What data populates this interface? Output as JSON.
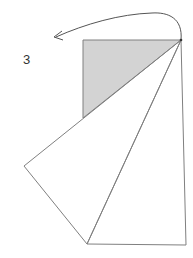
{
  "figure": {
    "label": "3",
    "label_position": {
      "x": 23,
      "y": 53
    },
    "stroke_color": "#808080",
    "fill_color": "#d3d3d3",
    "background": "#ffffff",
    "points": {
      "apex": [
        181,
        40
      ],
      "rect_top_left": [
        83,
        40
      ],
      "rect_bottom_left": [
        83,
        118
      ],
      "left_vertex": [
        24,
        166
      ],
      "bottom_left": [
        87,
        244
      ],
      "bottom_right": [
        186,
        245
      ]
    },
    "shaded_triangle": [
      [
        83,
        40
      ],
      [
        181,
        40
      ],
      [
        83,
        118
      ]
    ],
    "polygons": [
      {
        "name": "rotated-triangle",
        "points": [
          [
            181,
            40
          ],
          [
            24,
            166
          ],
          [
            87,
            244
          ]
        ]
      },
      {
        "name": "original-triangle",
        "points": [
          [
            181,
            40
          ],
          [
            87,
            244
          ],
          [
            186,
            245
          ]
        ]
      }
    ],
    "rotation_arrow": {
      "start": [
        181,
        40
      ],
      "end": [
        54,
        37
      ],
      "direction": "counter-clockwise"
    }
  }
}
